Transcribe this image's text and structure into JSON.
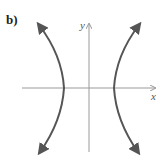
{
  "figure": {
    "part_label": "b)",
    "x_axis_label": "x",
    "y_axis_label": "y",
    "curve": "hyperbola opening left and right",
    "colors": {
      "curve": "#555555",
      "axis": "#999999"
    }
  }
}
